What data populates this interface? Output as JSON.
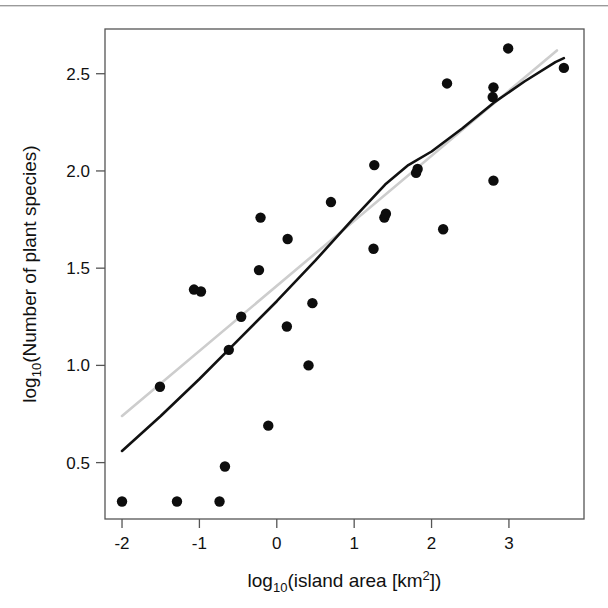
{
  "figure": {
    "background_color": "#ffffff",
    "frame_color": "#555555",
    "point_color": "#0d0d0d",
    "fit_line_color": "#111111",
    "reference_line_color": "#cccccc",
    "top_rule": "page-scan-rule"
  },
  "chart_data": {
    "type": "scatter",
    "title": "",
    "xlabel": "log10(island area [km2])",
    "ylabel": "log10(Number of plant species)",
    "xlabel_parts": {
      "base": "log",
      "sub": "10",
      "rest_open": "(island area [km",
      "sup": "2",
      "rest_close": "])"
    },
    "ylabel_parts": {
      "base": "log",
      "sub": "10",
      "rest": "(Number of plant species)"
    },
    "xlim": [
      -2.22,
      3.97
    ],
    "ylim": [
      0.21,
      2.73
    ],
    "xticks": [
      -2,
      -1,
      0,
      1,
      2,
      3
    ],
    "xtick_labels": [
      "-2",
      "-1",
      "0",
      "1",
      "2",
      "3"
    ],
    "yticks": [
      0.5,
      1.0,
      1.5,
      2.0,
      2.5
    ],
    "ytick_labels": [
      "0.5",
      "1.0",
      "1.5",
      "2.0",
      "2.5"
    ],
    "grid": false,
    "legend": null,
    "points": [
      {
        "x": -2.0,
        "y": 0.3
      },
      {
        "x": -1.29,
        "y": 0.3
      },
      {
        "x": -0.74,
        "y": 0.3
      },
      {
        "x": -0.67,
        "y": 0.48
      },
      {
        "x": -0.11,
        "y": 0.69
      },
      {
        "x": 0.41,
        "y": 1.0
      },
      {
        "x": -1.51,
        "y": 0.89
      },
      {
        "x": -0.62,
        "y": 1.08
      },
      {
        "x": 0.13,
        "y": 1.2
      },
      {
        "x": -0.46,
        "y": 1.25
      },
      {
        "x": -1.07,
        "y": 1.39
      },
      {
        "x": -0.98,
        "y": 1.38
      },
      {
        "x": 0.46,
        "y": 1.32
      },
      {
        "x": -0.23,
        "y": 1.49
      },
      {
        "x": 1.25,
        "y": 1.6
      },
      {
        "x": 0.14,
        "y": 1.65
      },
      {
        "x": 2.15,
        "y": 1.7
      },
      {
        "x": -0.21,
        "y": 1.76
      },
      {
        "x": 1.39,
        "y": 1.76
      },
      {
        "x": 1.41,
        "y": 1.78
      },
      {
        "x": 0.7,
        "y": 1.84
      },
      {
        "x": 2.8,
        "y": 1.95
      },
      {
        "x": 1.8,
        "y": 1.99
      },
      {
        "x": 1.82,
        "y": 2.01
      },
      {
        "x": 1.26,
        "y": 2.03
      },
      {
        "x": 2.2,
        "y": 2.45
      },
      {
        "x": 2.79,
        "y": 2.38
      },
      {
        "x": 2.8,
        "y": 2.43
      },
      {
        "x": 2.99,
        "y": 2.63
      },
      {
        "x": 3.71,
        "y": 2.53
      }
    ],
    "fit_curve": {
      "name": "fitted-spline",
      "color": "#111111",
      "width": 2.6,
      "points": [
        {
          "x": -2.0,
          "y": 0.56
        },
        {
          "x": -1.5,
          "y": 0.74
        },
        {
          "x": -1.0,
          "y": 0.93
        },
        {
          "x": -0.5,
          "y": 1.13
        },
        {
          "x": 0.0,
          "y": 1.33
        },
        {
          "x": 0.5,
          "y": 1.54
        },
        {
          "x": 1.0,
          "y": 1.76
        },
        {
          "x": 1.4,
          "y": 1.93
        },
        {
          "x": 1.7,
          "y": 2.03
        },
        {
          "x": 2.0,
          "y": 2.1
        },
        {
          "x": 2.4,
          "y": 2.22
        },
        {
          "x": 2.8,
          "y": 2.35
        },
        {
          "x": 3.2,
          "y": 2.46
        },
        {
          "x": 3.6,
          "y": 2.56
        },
        {
          "x": 3.71,
          "y": 2.58
        }
      ]
    },
    "reference_line": {
      "name": "linear-reference",
      "color": "#cdcdcd",
      "width": 2.6,
      "x0": -2.0,
      "y0": 0.74,
      "x1": 3.62,
      "y1": 2.62
    }
  }
}
